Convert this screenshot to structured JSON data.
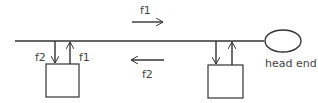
{
  "diagram": {
    "labels": {
      "top_arrow": "f1",
      "bottom_arrow": "f2",
      "left_down": "f2",
      "left_up": "f1",
      "head_end": "head end"
    },
    "colors": {
      "line": "#333333",
      "text": "#444444"
    }
  }
}
